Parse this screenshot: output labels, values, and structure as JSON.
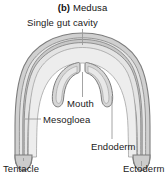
{
  "figure": {
    "caption_prefix": "(b)",
    "caption_text": "Medusa"
  },
  "labels": {
    "gut_cavity": "Single gut cavity",
    "mouth": "Mouth",
    "mesogloea": "Mesogloea",
    "endoderm": "Endoderm",
    "tentacle": "Tentacle",
    "ectoderm": "Ectoderm"
  },
  "colors": {
    "background": "#ffffff",
    "outline": "#8a8a8a",
    "outline_dark": "#6d6d6d",
    "fill_light": "#e2e2e2",
    "fill_mid": "#d2d2d2",
    "fill_dark": "#c2c2c2",
    "text": "#1a1a1a",
    "leader": "#9a9a9a"
  }
}
